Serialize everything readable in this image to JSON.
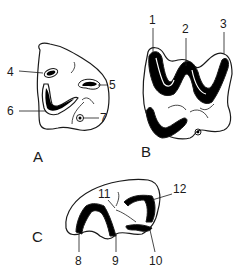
{
  "figure": {
    "panels": [
      {
        "id": "A",
        "label": "A",
        "callouts": [
          "4",
          "5",
          "6",
          "7"
        ]
      },
      {
        "id": "B",
        "label": "B",
        "callouts": [
          "1",
          "2",
          "3"
        ]
      },
      {
        "id": "C",
        "label": "C",
        "callouts": [
          "8",
          "9",
          "10",
          "11",
          "12"
        ]
      }
    ],
    "numbers": {
      "n1": "1",
      "n2": "2",
      "n3": "3",
      "n4": "4",
      "n5": "5",
      "n6": "6",
      "n7": "7",
      "n8": "8",
      "n9": "9",
      "n10": "10",
      "n11": "11",
      "n12": "12"
    },
    "letters": {
      "a": "A",
      "b": "B",
      "c": "C"
    },
    "colors": {
      "ink": "#1a1a1a",
      "fill": "#000000",
      "paper": "#ffffff"
    }
  }
}
